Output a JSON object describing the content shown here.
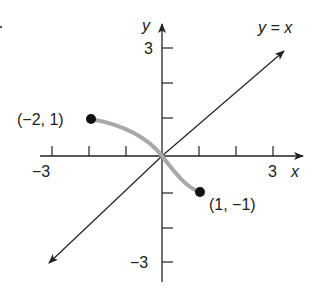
{
  "figure": {
    "type": "coordinate-graph",
    "axes": {
      "x_label": "x",
      "y_label": "y",
      "x_ticks": [
        -3,
        -2,
        -1,
        1,
        2,
        3
      ],
      "y_ticks": [
        -3,
        -2,
        -1,
        1,
        2,
        3
      ],
      "x_tick_labels": {
        "neg": "−3",
        "pos": "3"
      },
      "y_tick_labels": {
        "neg": "−3",
        "pos": "3"
      },
      "x_range": [
        -3.2,
        3.8
      ],
      "y_range": [
        -3.4,
        3.6
      ]
    },
    "line": {
      "label": "y = x",
      "equation": "y = x"
    },
    "curve": {
      "description": "Gray curve from (-2, 1) through origin to (1, -1)",
      "color": "#a9a9a9",
      "points": [
        [
          -2,
          1
        ],
        [
          0,
          0
        ],
        [
          1,
          -1
        ]
      ]
    },
    "points": [
      {
        "x": -2,
        "y": 1,
        "label": "(−2, 1)"
      },
      {
        "x": 1,
        "y": -1,
        "label": "(1, −1)"
      }
    ],
    "colors": {
      "axis": "#222222",
      "curve": "#a9a9a9",
      "point": "#111111"
    }
  }
}
